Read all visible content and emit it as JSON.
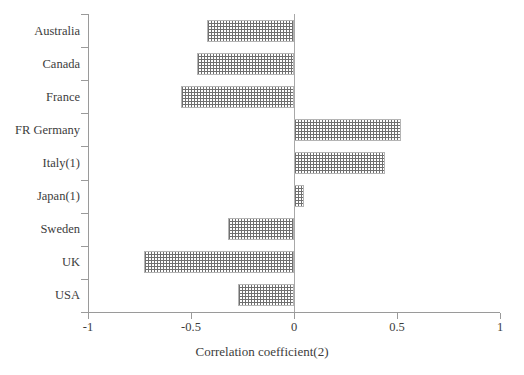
{
  "chart_data": {
    "type": "bar",
    "orientation": "horizontal",
    "title": "",
    "xlabel": "Correlation coefficient(2)",
    "ylabel": "",
    "categories": [
      "Australia",
      "Canada",
      "France",
      "FR Germany",
      "Italy(1)",
      "Japan(1)",
      "Sweden",
      "UK",
      "USA"
    ],
    "values": [
      -0.42,
      -0.47,
      -0.55,
      0.52,
      0.44,
      0.05,
      -0.32,
      -0.73,
      -0.27
    ],
    "xlim": [
      -1,
      1
    ],
    "xticks": [
      -1,
      -0.5,
      0,
      0.5,
      1
    ],
    "xtick_labels": [
      "-1",
      "-0.5",
      "0",
      "0.5",
      "1"
    ],
    "grid": false,
    "legend": null,
    "bar_fill": "dotted-hatch",
    "bar_edge_color": "#b4b4b4",
    "axis_color": "#9a9a9a",
    "text_color": "#3c3c3c"
  }
}
